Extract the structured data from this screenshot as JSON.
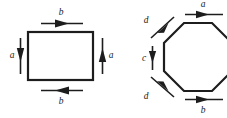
{
  "figure": {
    "title": "",
    "background_color": "#ffffff",
    "ink_color": "#1d1d1d",
    "shapes": [
      {
        "name": "rectangle",
        "sides": 4,
        "edge_labels": [
          "b",
          "a",
          "b",
          "a"
        ]
      },
      {
        "name": "octagon",
        "sides": 8,
        "edge_labels": [
          "a",
          "d",
          "c",
          "d",
          "b"
        ]
      }
    ]
  },
  "rectangle_figure": {
    "label_top": "b",
    "label_left": "a",
    "label_right": "a",
    "label_bottom": "b",
    "arrow_top_direction": "right",
    "arrow_left_direction": "down",
    "arrow_right_direction": "up",
    "arrow_bottom_direction": "left"
  },
  "octagon_figure": {
    "label_top": "a",
    "label_upper_left_diagonal": "d",
    "label_left": "c",
    "label_lower_left_diagonal": "d",
    "label_bottom": "b",
    "arrow_top_direction": "right",
    "arrow_upper_left_direction": "up-right",
    "arrow_left_direction": "down",
    "arrow_lower_left_direction": "down-right",
    "arrow_bottom_direction": "right"
  }
}
